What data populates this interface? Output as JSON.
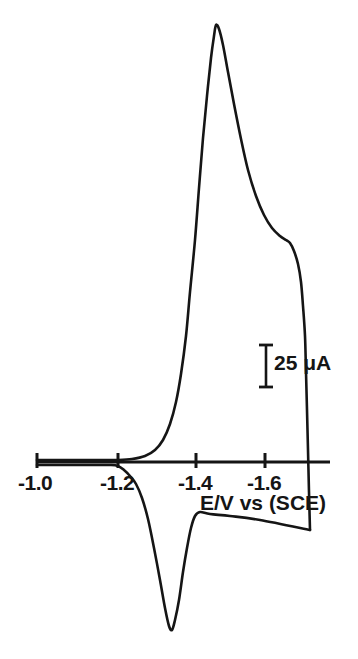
{
  "figure": {
    "kind": "cyclic-voltammogram",
    "background_color": "#ffffff",
    "trace_color": "#151515",
    "axis_color": "#151515"
  },
  "axis": {
    "title": "E/V vs (SCE)",
    "tick_labels": [
      "-1.0",
      "-1.2",
      "-1.4",
      "-1.6"
    ],
    "tick_values": [
      -1.0,
      -1.2,
      -1.4,
      -1.6
    ],
    "tick_x_px": [
      37,
      118,
      196,
      265
    ],
    "label_x_px": [
      18,
      100,
      178,
      247
    ],
    "baseline_y_px": 462,
    "line_start_x_px": 37,
    "line_end_x_px": 330
  },
  "scale_bar": {
    "label": "25 μA",
    "value": 25,
    "units": "μA",
    "x_px": 266,
    "top_y_px": 345,
    "bottom_y_px": 387,
    "cap_half_width_px": 7
  },
  "chart_data": {
    "type": "line",
    "title": "",
    "subtitle": "",
    "xlabel": "E/V vs (SCE)",
    "ylabel": "",
    "xlim": [
      -0.98,
      -1.73
    ],
    "ylim_microamp": [
      -62,
      118
    ],
    "grid": false,
    "legend": null,
    "annotations": [
      {
        "text": "25 μA",
        "role": "current-scale-bar",
        "value": 25,
        "units": "μA"
      }
    ],
    "axis_note": "Potential becomes more negative toward the right; current scale given by the 25 microampere bar.",
    "series": [
      {
        "name": "forward-cathodic-sweep",
        "direction": "negative-going",
        "points_px": [
          [
            37,
            460
          ],
          [
            60,
            460
          ],
          [
            85,
            460
          ],
          [
            105,
            460
          ],
          [
            118,
            460
          ],
          [
            132,
            459
          ],
          [
            145,
            456
          ],
          [
            155,
            450
          ],
          [
            163,
            440
          ],
          [
            170,
            424
          ],
          [
            176,
            402
          ],
          [
            181,
            374
          ],
          [
            186,
            336
          ],
          [
            190,
            292
          ],
          [
            195,
            240
          ],
          [
            199,
            188
          ],
          [
            203,
            138
          ],
          [
            207,
            96
          ],
          [
            211,
            58
          ],
          [
            214,
            36
          ],
          [
            216,
            25
          ],
          [
            219,
            29
          ],
          [
            223,
            45
          ],
          [
            228,
            72
          ],
          [
            234,
            104
          ],
          [
            241,
            139
          ],
          [
            248,
            170
          ],
          [
            256,
            196
          ],
          [
            264,
            215
          ],
          [
            272,
            228
          ],
          [
            280,
            236
          ],
          [
            286,
            240
          ],
          [
            290,
            243
          ],
          [
            294,
            251
          ],
          [
            298,
            264
          ],
          [
            301,
            282
          ],
          [
            303,
            306
          ],
          [
            305,
            336
          ],
          [
            306,
            372
          ],
          [
            307,
            410
          ],
          [
            308,
            450
          ],
          [
            309,
            492
          ],
          [
            310,
            530
          ]
        ]
      },
      {
        "name": "reverse-anodic-sweep",
        "direction": "positive-going",
        "points_px": [
          [
            310,
            530
          ],
          [
            260,
            520
          ],
          [
            230,
            516
          ],
          [
            210,
            514
          ],
          [
            200,
            512
          ],
          [
            195,
            516
          ],
          [
            191,
            528
          ],
          [
            187,
            548
          ],
          [
            183,
            572
          ],
          [
            179,
            600
          ],
          [
            175,
            620
          ],
          [
            172,
            630
          ],
          [
            169,
            626
          ],
          [
            165,
            608
          ],
          [
            160,
            580
          ],
          [
            154,
            548
          ],
          [
            148,
            519
          ],
          [
            142,
            498
          ],
          [
            136,
            484
          ],
          [
            130,
            476
          ],
          [
            124,
            470
          ],
          [
            118,
            466
          ],
          [
            110,
            465
          ],
          [
            95,
            465
          ],
          [
            75,
            465
          ],
          [
            55,
            465
          ],
          [
            37,
            465
          ]
        ]
      }
    ],
    "features": [
      {
        "name": "anodic-peak",
        "x_px": 216,
        "y_px": 25,
        "potential_v": -1.46,
        "description": "main sharp peak"
      },
      {
        "name": "shoulder-peak",
        "x_px": 288,
        "y_px": 240,
        "potential_v": -1.64,
        "description": "secondary shoulder on descending branch"
      },
      {
        "name": "cathodic-peak",
        "x_px": 172,
        "y_px": 630,
        "potential_v": -1.35,
        "description": "return wave trough"
      }
    ]
  }
}
